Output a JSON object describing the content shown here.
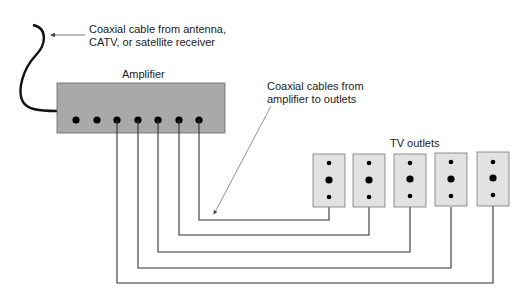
{
  "diagram": {
    "type": "wiring-diagram",
    "labels": {
      "input_cable_line1": "Coaxial cable from antenna,",
      "input_cable_line2": "CATV, or satellite receiver",
      "amplifier": "Amplifier",
      "output_cables_line1": "Coaxial cables from",
      "output_cables_line2": "amplifier to outlets",
      "tv_outlets": "TV outlets"
    },
    "amplifier": {
      "ports": 7,
      "connected_ports": 5,
      "fill": "#a9a9a9"
    },
    "outlets": [
      {
        "id": 1,
        "connected_to_port": 7
      },
      {
        "id": 2,
        "connected_to_port": 6
      },
      {
        "id": 3,
        "connected_to_port": 5
      },
      {
        "id": 4,
        "connected_to_port": 4
      },
      {
        "id": 5,
        "connected_to_port": 3
      }
    ],
    "colors": {
      "outlet_fill": "#e2e2e2",
      "wire": "#333333",
      "amplifier_fill": "#a9a9a9"
    }
  }
}
